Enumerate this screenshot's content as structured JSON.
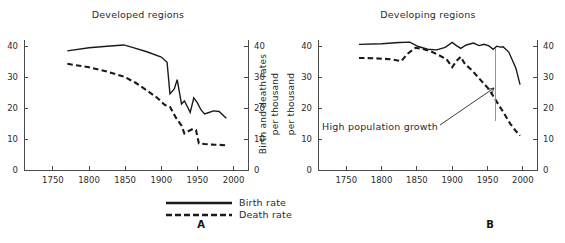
{
  "figure": {
    "width": 565,
    "height": 243,
    "background": "#ffffff",
    "ink_color": "#1a1a1a",
    "axis_color": "#4a4a4a"
  },
  "legend": {
    "items": [
      {
        "label": "Birth rate",
        "style": "solid"
      },
      {
        "label": "Death rate",
        "style": "dashed"
      }
    ]
  },
  "panels": [
    {
      "letter": "A",
      "title": "Developed regions"
    },
    {
      "letter": "B",
      "title": "Developing regions"
    }
  ],
  "axis_titles": {
    "right_line1": "Birth and death rates",
    "right_line2": "per thousand",
    "panel_b_left": "per thousand"
  },
  "annotation": {
    "text": "High population growth"
  },
  "chart_data": [
    {
      "type": "line",
      "panel": "A",
      "title": "Developed regions",
      "xlabel": "",
      "ylabel": "Birth and death rates per thousand",
      "xlim": [
        1710,
        2020
      ],
      "ylim": [
        0,
        42
      ],
      "xticks": [
        1750,
        1800,
        1850,
        1900,
        1950,
        2000
      ],
      "yticks": [
        0,
        10,
        20,
        30,
        40
      ],
      "ytick_labels_both_sides": true,
      "grid": false,
      "legend_position": "below-figure",
      "series": [
        {
          "name": "Birth rate",
          "style": "solid",
          "x": [
            1770,
            1800,
            1825,
            1848,
            1860,
            1880,
            1900,
            1908,
            1912,
            1918,
            1922,
            1928,
            1932,
            1936,
            1940,
            1945,
            1950,
            1955,
            1960,
            1965,
            1972,
            1980,
            1990
          ],
          "y": [
            38.5,
            39.5,
            40.0,
            40.4,
            39.6,
            38.2,
            36.5,
            34.8,
            24.6,
            26.2,
            29.2,
            21.3,
            22.3,
            20.5,
            18.6,
            23.3,
            21.7,
            19.4,
            18.1,
            18.5,
            19.1,
            18.9,
            16.7
          ]
        },
        {
          "name": "Death rate",
          "style": "dashed",
          "x": [
            1770,
            1800,
            1825,
            1848,
            1865,
            1880,
            1895,
            1905,
            1912,
            1920,
            1928,
            1932,
            1938,
            1944,
            1948,
            1952,
            1960,
            1972,
            1990
          ],
          "y": [
            34.3,
            33.2,
            31.8,
            30.2,
            28.1,
            25.7,
            23.2,
            21.0,
            20.4,
            17.0,
            14.3,
            11.8,
            12.6,
            13.3,
            12.9,
            8.6,
            8.4,
            8.2,
            8.0
          ]
        }
      ]
    },
    {
      "type": "line",
      "panel": "B",
      "title": "Developing regions",
      "xlabel": "",
      "ylabel": "per thousand",
      "xlim": [
        1710,
        2020
      ],
      "ylim": [
        0,
        42
      ],
      "xticks": [
        1750,
        1800,
        1850,
        1900,
        1950,
        2000
      ],
      "yticks": [
        0,
        10,
        20,
        30,
        40
      ],
      "ytick_labels_both_sides": true,
      "grid": false,
      "legend_position": "below-figure",
      "annotations": [
        {
          "text": "High population growth",
          "points_to": "gap between birth and death rate curves near 1980"
        }
      ],
      "series": [
        {
          "name": "Birth rate",
          "style": "solid",
          "x": [
            1768,
            1800,
            1825,
            1840,
            1852,
            1865,
            1878,
            1890,
            1900,
            1906,
            1912,
            1920,
            1930,
            1938,
            1945,
            1952,
            1958,
            1963,
            1968,
            1972,
            1980,
            1990,
            1996
          ],
          "y": [
            40.6,
            40.8,
            41.2,
            41.3,
            39.9,
            39.0,
            38.8,
            39.6,
            41.2,
            40.2,
            39.3,
            40.4,
            41.0,
            40.2,
            40.6,
            40.1,
            39.0,
            40.0,
            39.7,
            39.8,
            38.1,
            33.0,
            27.6
          ]
        },
        {
          "name": "Death rate",
          "style": "dashed",
          "x": [
            1768,
            1790,
            1812,
            1828,
            1836,
            1848,
            1858,
            1870,
            1882,
            1892,
            1900,
            1906,
            1912,
            1918,
            1928,
            1940,
            1952,
            1962,
            1972,
            1982,
            1990,
            1996
          ],
          "y": [
            36.2,
            36.1,
            35.8,
            35.2,
            37.4,
            39.5,
            39.1,
            38.3,
            37.0,
            35.8,
            33.2,
            35.2,
            36.6,
            34.2,
            32.2,
            29.1,
            26.1,
            22.4,
            18.8,
            15.0,
            12.6,
            11.1
          ]
        }
      ]
    }
  ]
}
